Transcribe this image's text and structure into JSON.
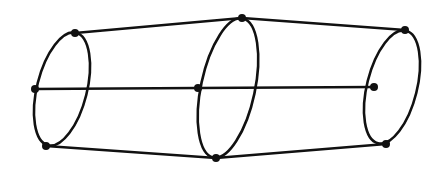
{
  "diagram": {
    "stroke_color": "#111111",
    "background": "#ffffff",
    "ellipses": [
      {
        "id": "left",
        "cx": 62,
        "cy": 89,
        "rx": 25,
        "ry": 58,
        "rotate": 14
      },
      {
        "id": "middle",
        "cx": 228,
        "cy": 88,
        "rx": 27,
        "ry": 71,
        "rotate": 12
      },
      {
        "id": "right",
        "cx": 392,
        "cy": 87,
        "rx": 25,
        "ry": 58,
        "rotate": 14
      }
    ],
    "nodes": [
      {
        "id": "L-top",
        "x": 75,
        "y": 33
      },
      {
        "id": "L-mid",
        "x": 35,
        "y": 89
      },
      {
        "id": "L-bot",
        "x": 46,
        "y": 146
      },
      {
        "id": "M-top",
        "x": 242,
        "y": 18
      },
      {
        "id": "M-mid",
        "x": 198,
        "y": 88
      },
      {
        "id": "M-bot",
        "x": 216,
        "y": 158
      },
      {
        "id": "R-top",
        "x": 405,
        "y": 30
      },
      {
        "id": "R-mid",
        "x": 374,
        "y": 87
      },
      {
        "id": "R-bot",
        "x": 386,
        "y": 144
      }
    ],
    "edges": [
      {
        "from": "L-top",
        "to": "M-top"
      },
      {
        "from": "M-top",
        "to": "R-top"
      },
      {
        "from": "L-mid",
        "to": "M-mid"
      },
      {
        "from": "M-mid",
        "to": "R-mid"
      },
      {
        "from": "L-bot",
        "to": "M-bot"
      },
      {
        "from": "M-bot",
        "to": "R-bot"
      }
    ]
  }
}
